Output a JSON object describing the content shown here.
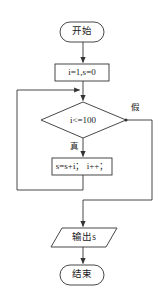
{
  "diagram": {
    "type": "flowchart",
    "title": "",
    "language": "zh-CN",
    "orientation": "top-to-bottom",
    "stroke_color": "#333333",
    "background_color": "#ffffff",
    "text_color": "#1a1a1a",
    "nodes": [
      {
        "id": "start",
        "shape": "terminator",
        "label": "开始"
      },
      {
        "id": "init",
        "shape": "process",
        "label": "i=1,s=0"
      },
      {
        "id": "decision",
        "shape": "decision",
        "label": "i<=100"
      },
      {
        "id": "body",
        "shape": "process",
        "label": "s=s+i； i++；"
      },
      {
        "id": "output",
        "shape": "parallelogram",
        "label": "输出s"
      },
      {
        "id": "end",
        "shape": "terminator",
        "label": "结束"
      }
    ],
    "edge_labels": {
      "true_branch": "真",
      "false_branch": "假"
    }
  }
}
